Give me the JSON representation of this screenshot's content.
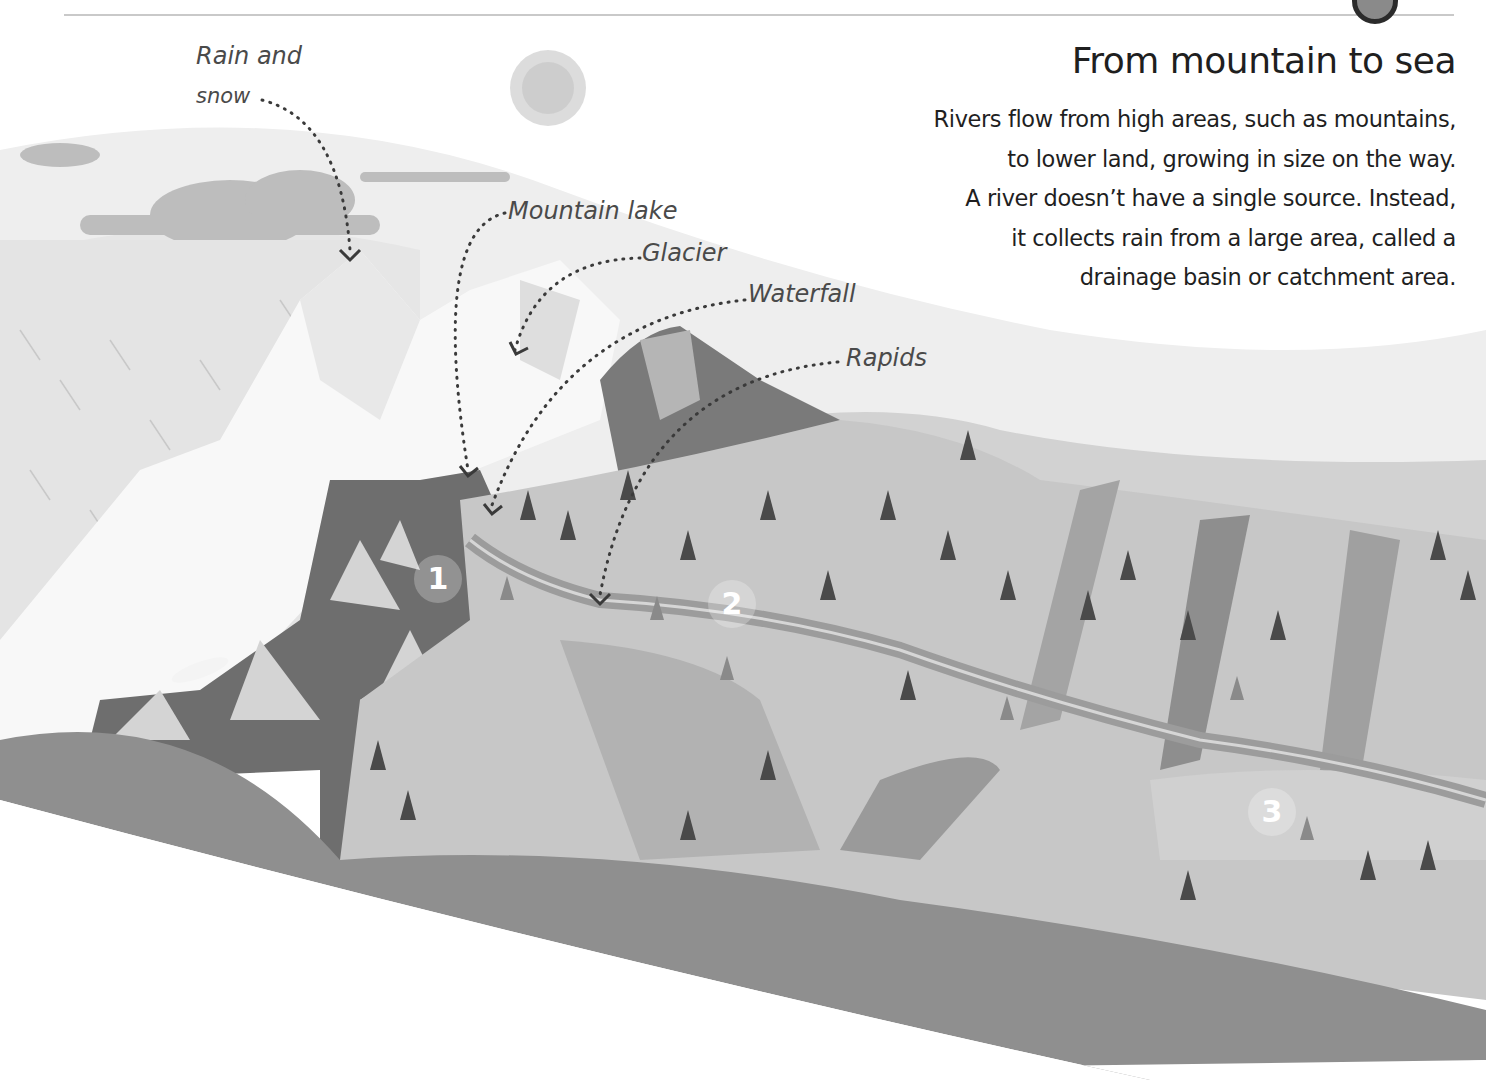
{
  "page": {
    "title": "From mountain to sea",
    "body_lines": [
      "Rivers flow from high areas, such as mountains,",
      "to lower land, growing in size on the way.",
      "A river doesn’t have a single source. Instead,",
      "it collects rain from a large area, called a",
      "drainage basin or catchment area."
    ]
  },
  "labels": {
    "rain_snow_line1": "Rain and",
    "rain_snow_line2": "snow",
    "mountain_lake": "Mountain lake",
    "glacier": "Glacier",
    "waterfall": "Waterfall",
    "rapids": "Rapids"
  },
  "markers": [
    "1",
    "2",
    "3"
  ],
  "colors": {
    "sky": "#f2f2f2",
    "snow": "#f7f7f7",
    "rock_dark": "#6e6e6e",
    "hill_light": "#c4c4c4",
    "hill_mid": "#a9a9a9",
    "ground_bottom": "#8f8f8f",
    "tree_dark": "#4a4a4a",
    "river": "#9a9a9a",
    "text": "#1f1f1f",
    "label_text": "#4a4a4a"
  }
}
